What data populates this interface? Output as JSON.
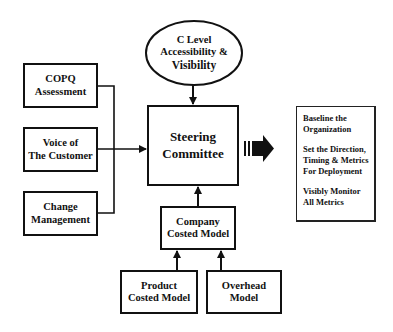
{
  "diagram": {
    "ellipse": {
      "lines": [
        "C Level",
        "Accessibility &",
        "Visibility"
      ]
    },
    "inputs": [
      {
        "lines": [
          "COPQ",
          "Assessment"
        ]
      },
      {
        "lines": [
          "Voice of",
          "The Customer"
        ]
      },
      {
        "lines": [
          "Change",
          "Management"
        ]
      }
    ],
    "center": {
      "lines": [
        "Steering",
        "Committee"
      ]
    },
    "company_model": {
      "lines": [
        "Company",
        "Costed Model"
      ]
    },
    "product_model": {
      "lines": [
        "Product",
        "Costed Model"
      ]
    },
    "overhead_model": {
      "lines": [
        "Overhead",
        "Model"
      ]
    },
    "outcomes": [
      {
        "lines": [
          "Baseline the",
          "Organization"
        ]
      },
      {
        "lines": [
          "Set the Direction,",
          "Timing & Metrics",
          "For Deployment"
        ]
      },
      {
        "lines": [
          "Visibly Monitor",
          "All Metrics"
        ]
      }
    ],
    "edges": [
      {
        "from": "C Level Accessibility & Visibility",
        "to": "Steering Committee"
      },
      {
        "from": "COPQ Assessment",
        "to": "Steering Committee"
      },
      {
        "from": "Voice of The Customer",
        "to": "Steering Committee"
      },
      {
        "from": "Change Management",
        "to": "Steering Committee"
      },
      {
        "from": "Company Costed Model",
        "to": "Steering Committee"
      },
      {
        "from": "Product Costed Model",
        "to": "Company Costed Model"
      },
      {
        "from": "Overhead Model",
        "to": "Company Costed Model"
      },
      {
        "from": "Steering Committee",
        "to": "Outcomes"
      }
    ]
  }
}
